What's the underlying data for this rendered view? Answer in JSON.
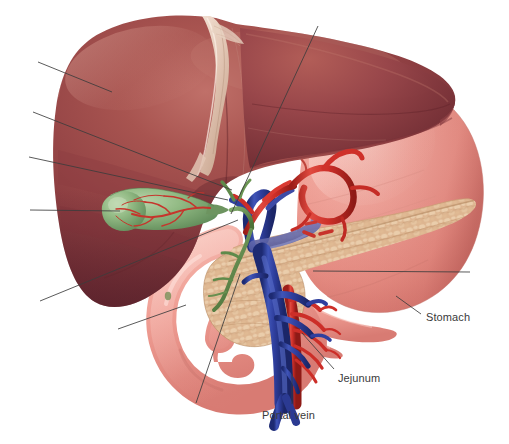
{
  "figure": {
    "kind": "medical-anatomical-illustration",
    "width": 509,
    "height": 444,
    "background_color": "#ffffff"
  },
  "labels": [
    {
      "id": "stomach",
      "text": "Stomach",
      "x": 426,
      "y": 311,
      "color": "#3a3a3a"
    },
    {
      "id": "jejunum",
      "text": "Jejunum",
      "x": 338,
      "y": 372,
      "color": "#3a3a3a"
    },
    {
      "id": "portal_vein",
      "text": "Portal vein",
      "x": 262,
      "y": 409,
      "color": "#3a3a3a"
    }
  ],
  "leader_lines": [
    {
      "id": "leader-liver-upper-left",
      "from": [
        38,
        62
      ],
      "to": [
        112,
        92
      ],
      "labeled": false
    },
    {
      "id": "leader-liver-mid-left",
      "from": [
        33,
        112
      ],
      "to": [
        232,
        190
      ],
      "labeled": false
    },
    {
      "id": "leader-liver-lower-left",
      "from": [
        29,
        157
      ],
      "to": [
        228,
        200
      ],
      "labeled": false
    },
    {
      "id": "leader-gallbladder",
      "from": [
        30,
        210
      ],
      "to": [
        120,
        211
      ],
      "labeled": false
    },
    {
      "id": "leader-liver-inferior",
      "from": [
        40,
        301
      ],
      "to": [
        238,
        220
      ],
      "labeled": false
    },
    {
      "id": "leader-hilum-top",
      "from": [
        318,
        26
      ],
      "to": [
        231,
        214
      ],
      "labeled": false
    },
    {
      "id": "leader-duodenum",
      "from": [
        118,
        329
      ],
      "to": [
        186,
        305
      ],
      "labeled": false
    },
    {
      "id": "leader-pancreas-head",
      "from": [
        196,
        403
      ],
      "to": [
        240,
        274
      ],
      "labeled": false
    },
    {
      "id": "leader-pancreas-body",
      "from": [
        470,
        272
      ],
      "to": [
        313,
        271
      ],
      "labeled": false
    },
    {
      "id": "leader-stomach",
      "from": [
        421,
        314
      ],
      "to": [
        396,
        296
      ],
      "labeled": true,
      "label": "stomach"
    },
    {
      "id": "leader-jejunum",
      "from": [
        334,
        369
      ],
      "to": [
        302,
        333
      ],
      "labeled": true,
      "label": "jejunum"
    },
    {
      "id": "leader-portal-vein",
      "from": [
        292,
        404
      ],
      "to": [
        292,
        374
      ],
      "labeled": true,
      "label": "portal_vein"
    }
  ],
  "structures": [
    {
      "id": "liver",
      "name": "Liver",
      "color": "#9c4a48",
      "shade_dark": "#6e2a33",
      "shade_light": "#b7615c",
      "labeled": false
    },
    {
      "id": "falciform",
      "name": "Falciform ligament",
      "color": "#e8cfc2",
      "labeled": false
    },
    {
      "id": "gallbladder",
      "name": "Gallbladder",
      "color": "#89b37e",
      "vessel_color": "#c6352c",
      "labeled": false
    },
    {
      "id": "hepatic-artery",
      "name": "Hepatic artery",
      "color": "#cc2e28",
      "labeled": false
    },
    {
      "id": "bile-duct",
      "name": "Common bile duct",
      "color": "#5f8a4a",
      "labeled": false
    },
    {
      "id": "portal-vein",
      "name": "Portal vein",
      "color": "#32419e",
      "labeled": true,
      "label": "portal_vein"
    },
    {
      "id": "splenic-vein",
      "name": "Splenic vein",
      "color": "#6a6fae",
      "labeled": false
    },
    {
      "id": "pancreas",
      "name": "Pancreas",
      "color": "#ddb590",
      "shade_dark": "#b98e64",
      "labeled": false
    },
    {
      "id": "duodenum",
      "name": "Duodenum",
      "color": "#ef9d93",
      "labeled": false
    },
    {
      "id": "stomach",
      "name": "Stomach",
      "color": "#ef9b91",
      "shade_dark": "#d8736a",
      "labeled": true,
      "label": "stomach"
    },
    {
      "id": "jejunum",
      "name": "Jejunum",
      "color": "#ef9d93",
      "labeled": true,
      "label": "jejunum"
    },
    {
      "id": "sma",
      "name": "Superior mesenteric artery",
      "color": "#cf312a",
      "labeled": false
    }
  ],
  "palette": {
    "liver_mid": "#9c4a48",
    "liver_dark": "#6e2a33",
    "liver_light": "#b7615c",
    "stomach_pink": "#ef9b91",
    "pancreas_tan": "#ddb590",
    "gallbladder_green": "#89b37e",
    "artery_red": "#cc2e28",
    "vein_blue": "#32419e",
    "duct_green": "#5f8a4a",
    "label_text": "#3a3a3a",
    "leader_line": "#3c3c3c",
    "background": "#ffffff"
  }
}
